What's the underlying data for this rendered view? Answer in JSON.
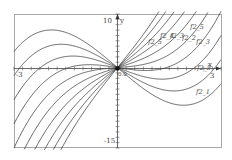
{
  "chart_data": {
    "type": "line",
    "title": "",
    "xlabel": "x",
    "ylabel": "y",
    "xlim": [
      -3,
      3
    ],
    "ylim": [
      -15,
      10
    ],
    "grid": false,
    "tick_labels": {
      "x_min": "-3",
      "x_max": "3",
      "y_max": "10",
      "y_min": "-15",
      "origin": "0.0"
    },
    "function_form": "y = 0.5*(x^3 - a*x)",
    "series": [
      {
        "name": "f2_1",
        "a": 11
      },
      {
        "name": "f2_2",
        "a": 8
      },
      {
        "name": "f2_3",
        "a": 5
      },
      {
        "name": "f2_4",
        "a": 2
      },
      {
        "name": "f2_5",
        "a": -1
      },
      {
        "name": "f2_6",
        "a": -4
      },
      {
        "name": "f2_7",
        "a": -7
      },
      {
        "name": "f2_8",
        "a": -10
      },
      {
        "name": "f2_9",
        "a": -13
      },
      {
        "name": "f2_10",
        "a": -16
      }
    ],
    "curve_labels": [
      {
        "text": "f2_5",
        "x": 190,
        "y": 29
      },
      {
        "text": "f2_5",
        "x": 148,
        "y": 44
      },
      {
        "text": "f2_4",
        "x": 160,
        "y": 38
      },
      {
        "text": "f2_3",
        "x": 170,
        "y": 38
      },
      {
        "text": "f2_2",
        "x": 182,
        "y": 40
      },
      {
        "text": "f2_3",
        "x": 196,
        "y": 44
      },
      {
        "text": "f2_5",
        "x": 197,
        "y": 70
      },
      {
        "text": "f2_1",
        "x": 196,
        "y": 94
      }
    ]
  }
}
